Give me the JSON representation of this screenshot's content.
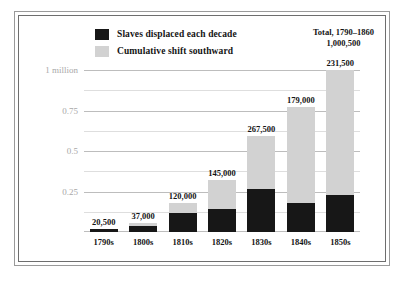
{
  "chart_data": {
    "type": "bar",
    "subtype": "stacked-bar",
    "title": "",
    "xlabel": "",
    "ylabel": "",
    "categories": [
      "1790s",
      "1800s",
      "1810s",
      "1820s",
      "1830s",
      "1840s",
      "1850s"
    ],
    "series": [
      {
        "name": "Slaves displaced each decade",
        "color": "#171717",
        "values": [
          20500,
          37000,
          120000,
          145000,
          267500,
          179000,
          231500
        ],
        "value_labels": [
          "20,500",
          "37,000",
          "120,000",
          "145,000",
          "267,500",
          "179,000",
          "231,500"
        ]
      },
      {
        "name": "Cumulative shift southward",
        "color": "#d2d2d2",
        "values": [
          20500,
          57500,
          177500,
          322500,
          590000,
          769000,
          1000500
        ]
      }
    ],
    "ylim": [
      0,
      1000500
    ],
    "yticks": [
      250000,
      500000,
      750000,
      1000000
    ],
    "ytick_labels": [
      "0.25",
      "0.5",
      "0.75",
      "1 million"
    ],
    "minor_yticks": [
      125000,
      375000,
      625000,
      875000
    ],
    "grid": true,
    "legend_position": "top-left",
    "annotation": {
      "line1": "Total, 1790–1860",
      "line2": "1,000,500"
    }
  },
  "legend": {
    "items": [
      {
        "label": "Slaves displaced each decade",
        "color": "#171717"
      },
      {
        "label": "Cumulative shift southward",
        "color": "#d2d2d2"
      }
    ]
  }
}
